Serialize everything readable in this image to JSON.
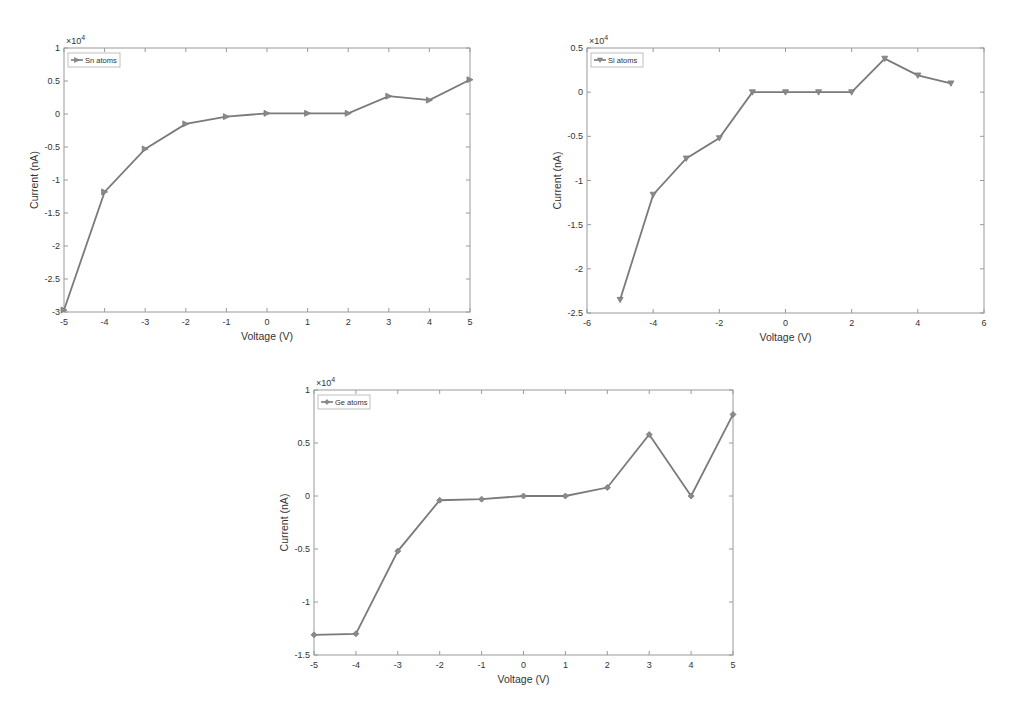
{
  "chart_data": [
    {
      "type": "line",
      "title": "",
      "xlabel": "Voltage (V)",
      "ylabel": "Current (nA)",
      "y_multiplier": "×10^4",
      "xlim": [
        -5,
        5
      ],
      "ylim": [
        -3,
        1
      ],
      "xticks": [
        -5,
        -4,
        -3,
        -2,
        -1,
        0,
        1,
        2,
        3,
        4,
        5
      ],
      "yticks": [
        -3,
        -2.5,
        -2,
        -1.5,
        -1,
        -0.5,
        0,
        0.5,
        1
      ],
      "legend_position": "upper left",
      "grid": false,
      "marker": "triangle-right",
      "series": [
        {
          "name": "Sn atoms",
          "x": [
            -5,
            -4,
            -3,
            -2,
            -1,
            0,
            1,
            2,
            3,
            4,
            5
          ],
          "values": [
            -2.97,
            -1.18,
            -0.53,
            -0.15,
            -0.04,
            0.01,
            0.01,
            0.01,
            0.27,
            0.21,
            0.52
          ]
        }
      ]
    },
    {
      "type": "line",
      "title": "",
      "xlabel": "Voltage (V)",
      "ylabel": "Current (nA)",
      "y_multiplier": "×10^4",
      "xlim": [
        -6,
        6
      ],
      "ylim": [
        -2.5,
        0.5
      ],
      "xticks": [
        -6,
        -4,
        -2,
        0,
        2,
        4,
        6
      ],
      "yticks": [
        -2.5,
        -2,
        -1.5,
        -1,
        -0.5,
        0,
        0.5
      ],
      "legend_position": "upper left",
      "grid": false,
      "marker": "triangle-down",
      "series": [
        {
          "name": "Si atoms",
          "x": [
            -5,
            -4,
            -3,
            -2,
            -1,
            0,
            1,
            2,
            3,
            4,
            5
          ],
          "values": [
            -2.35,
            -1.16,
            -0.75,
            -0.52,
            0.0,
            0.0,
            0.0,
            0.0,
            0.38,
            0.19,
            0.1
          ]
        }
      ]
    },
    {
      "type": "line",
      "title": "",
      "xlabel": "Voltage (V)",
      "ylabel": "Current (nA)",
      "y_multiplier": "×10^4",
      "xlim": [
        -5,
        5
      ],
      "ylim": [
        -1.5,
        1
      ],
      "xticks": [
        -5,
        -4,
        -3,
        -2,
        -1,
        0,
        1,
        2,
        3,
        4,
        5
      ],
      "yticks": [
        -1.5,
        -1,
        -0.5,
        0,
        0.5,
        1
      ],
      "legend_position": "upper left",
      "grid": false,
      "marker": "diamond",
      "series": [
        {
          "name": "Ge atoms",
          "x": [
            -5,
            -4,
            -3,
            -2,
            -1,
            0,
            1,
            2,
            3,
            4,
            5
          ],
          "values": [
            -1.31,
            -1.3,
            -0.52,
            -0.04,
            -0.03,
            0.0,
            0.0,
            0.08,
            0.58,
            0.0,
            0.77
          ]
        }
      ]
    }
  ],
  "charts": [
    {
      "id": "sn",
      "box": {
        "left": 64,
        "top": 48,
        "right": 470,
        "bottom": 312
      },
      "xtick_labels": [
        "-5",
        "-4",
        "-3",
        "-2",
        "-1",
        "0",
        "1",
        "2",
        "3",
        "4",
        "5"
      ],
      "ytick_labels": [
        "-3",
        "-2.5",
        "-2",
        "-1.5",
        "-1",
        "-0.5",
        "0",
        "0.5",
        "1"
      ],
      "multiplier_base": "×10",
      "multiplier_exp": "4",
      "xlabel": "Voltage (V)",
      "ylabel": "Current (nA)",
      "legend_label": "Sn atoms"
    },
    {
      "id": "si",
      "box": {
        "left": 587,
        "top": 48,
        "right": 984,
        "bottom": 313
      },
      "xtick_labels": [
        "-6",
        "-4",
        "-2",
        "0",
        "2",
        "4",
        "6"
      ],
      "ytick_labels": [
        "-2.5",
        "-2",
        "-1.5",
        "-1",
        "-0.5",
        "0",
        "0.5"
      ],
      "multiplier_base": "×10",
      "multiplier_exp": "4",
      "xlabel": "Voltage (V)",
      "ylabel": "Current (nA)",
      "legend_label": "Si atoms"
    },
    {
      "id": "ge",
      "box": {
        "left": 314,
        "top": 390,
        "right": 733,
        "bottom": 655
      },
      "xtick_labels": [
        "-5",
        "-4",
        "-3",
        "-2",
        "-1",
        "0",
        "1",
        "2",
        "3",
        "4",
        "5"
      ],
      "ytick_labels": [
        "-1.5",
        "-1",
        "-0.5",
        "0",
        "0.5",
        "1"
      ],
      "multiplier_base": "×10",
      "multiplier_exp": "4",
      "xlabel": "Voltage (V)",
      "ylabel": "Current (nA)",
      "legend_label": "Ge atoms"
    }
  ],
  "colors": {
    "line": "#7a7a7a",
    "marker": "#8a8a8a",
    "axis": "#9a9a9a",
    "text": "#333333",
    "legend_border": "#b0b0b0"
  }
}
